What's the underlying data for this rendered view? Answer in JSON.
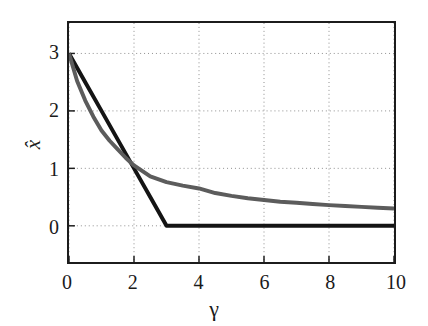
{
  "chart_data": {
    "type": "line",
    "title": "",
    "xlabel": "γ",
    "ylabel": "x̂",
    "xlim": [
      0,
      10
    ],
    "ylim": [
      -0.63,
      3.53
    ],
    "xticks": [
      0,
      2,
      4,
      6,
      8,
      10
    ],
    "yticks": [
      0,
      1,
      2,
      3
    ],
    "xtick_labels": [
      "0",
      "2",
      "4",
      "6",
      "8",
      "10"
    ],
    "ytick_labels": [
      "0",
      "1",
      "2",
      "3"
    ],
    "grid": true,
    "grid_style": "dotted",
    "legend": null,
    "series": [
      {
        "name": "soft-threshold",
        "color": "#141414",
        "width": 4.0,
        "x": [
          0,
          0.5,
          1,
          1.5,
          2,
          2.5,
          3,
          3.5,
          4,
          5,
          6,
          7,
          8,
          9,
          10
        ],
        "values": [
          3,
          2.5,
          2,
          1.5,
          1,
          0.5,
          0,
          0,
          0,
          0,
          0,
          0,
          0,
          0,
          0
        ]
      },
      {
        "name": "ridge-shrinkage",
        "color": "#5c5c5c",
        "width": 4.0,
        "x": [
          0,
          0.25,
          0.5,
          0.75,
          1,
          1.25,
          1.5,
          1.75,
          2,
          2.5,
          3,
          3.5,
          4,
          4.5,
          5,
          5.5,
          6,
          6.5,
          7,
          7.5,
          8,
          8.5,
          9,
          9.5,
          10
        ],
        "values": [
          3,
          2.52,
          2.18,
          1.9,
          1.66,
          1.48,
          1.33,
          1.18,
          1.05,
          0.86,
          0.76,
          0.7,
          0.65,
          0.57,
          0.52,
          0.48,
          0.45,
          0.42,
          0.4,
          0.38,
          0.36,
          0.345,
          0.33,
          0.315,
          0.3
        ]
      }
    ]
  },
  "axes": {
    "border_color": "#1c1c1c",
    "grid_color": "#8c8c8c",
    "background": "#ffffff"
  }
}
